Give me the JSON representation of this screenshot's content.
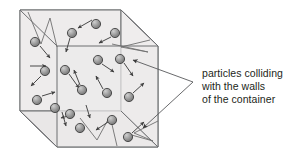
{
  "figure": {
    "title": "particles colliding with the walls of the container",
    "type": "gas-particle-container-diagram"
  },
  "caption": {
    "line1": "particles colliding",
    "line2": "with the walls",
    "line3": "of the container"
  },
  "colors": {
    "background": "#ffffff",
    "cube_line": "#6d6e71",
    "cube_face_front": "#eceaea",
    "cube_face_top": "#e4e2e2",
    "cube_face_left": "#e8e6e6",
    "particle_fill": "#9a9a9a",
    "particle_stroke": "#3b3b3b",
    "particle_highlight": "#d9d9d9",
    "arrow": "#404040",
    "callout_line": "#58595b",
    "text": "#231f20"
  },
  "container": {
    "label": "cube-container",
    "vertices": {
      "front_top_left": [
        57,
        46
      ],
      "front_top_right": [
        158,
        46
      ],
      "front_bottom_left": [
        57,
        147
      ],
      "front_bottom_right": [
        158,
        147
      ],
      "back_top_left": [
        20,
        10
      ],
      "back_top_right": [
        121,
        10
      ],
      "back_bottom_left": [
        20,
        111
      ],
      "back_bottom_right": [
        121,
        111
      ]
    }
  },
  "particles": [
    {
      "id": 1,
      "cx": 35,
      "cy": 42,
      "r": 4.6
    },
    {
      "id": 2,
      "cx": 45,
      "cy": 71,
      "r": 4.6
    },
    {
      "id": 3,
      "cx": 37,
      "cy": 100,
      "r": 4.6
    },
    {
      "id": 4,
      "cx": 72,
      "cy": 33,
      "r": 4.6
    },
    {
      "id": 5,
      "cx": 96,
      "cy": 24,
      "r": 4.6
    },
    {
      "id": 6,
      "cx": 115,
      "cy": 33,
      "r": 4.6
    },
    {
      "id": 7,
      "cx": 65,
      "cy": 70,
      "r": 4.6
    },
    {
      "id": 8,
      "cx": 98,
      "cy": 60,
      "r": 4.6
    },
    {
      "id": 9,
      "cx": 120,
      "cy": 59,
      "r": 4.6
    },
    {
      "id": 10,
      "cx": 82,
      "cy": 90,
      "r": 4.6
    },
    {
      "id": 11,
      "cx": 107,
      "cy": 93,
      "r": 4.6
    },
    {
      "id": 12,
      "cx": 129,
      "cy": 97,
      "r": 4.6
    },
    {
      "id": 13,
      "cx": 55,
      "cy": 108,
      "r": 4.6
    },
    {
      "id": 14,
      "cx": 70,
      "cy": 114,
      "r": 4.6
    },
    {
      "id": 15,
      "cx": 80,
      "cy": 128,
      "r": 4.6
    },
    {
      "id": 16,
      "cx": 112,
      "cy": 120,
      "r": 4.6
    },
    {
      "id": 17,
      "cx": 128,
      "cy": 137,
      "r": 4.6
    }
  ],
  "velocity_arrows": [
    {
      "from": [
        40,
        46
      ],
      "to": [
        50,
        58
      ]
    },
    {
      "from": [
        41,
        76
      ],
      "to": [
        31,
        86
      ]
    },
    {
      "from": [
        42,
        96
      ],
      "to": [
        55,
        92
      ]
    },
    {
      "from": [
        92,
        20
      ],
      "to": [
        78,
        28
      ]
    },
    {
      "from": [
        70,
        38
      ],
      "to": [
        66,
        52
      ]
    },
    {
      "from": [
        111,
        37
      ],
      "to": [
        99,
        43
      ]
    },
    {
      "from": [
        69,
        74
      ],
      "to": [
        79,
        88
      ]
    },
    {
      "from": [
        102,
        64
      ],
      "to": [
        114,
        72
      ]
    },
    {
      "from": [
        124,
        63
      ],
      "to": [
        133,
        76
      ]
    },
    {
      "from": [
        80,
        85
      ],
      "to": [
        74,
        70
      ]
    },
    {
      "from": [
        103,
        89
      ],
      "to": [
        96,
        76
      ]
    },
    {
      "from": [
        133,
        93
      ],
      "to": [
        144,
        83
      ]
    },
    {
      "from": [
        62,
        112
      ],
      "to": [
        66,
        126
      ]
    },
    {
      "from": [
        75,
        114
      ],
      "to": [
        61,
        118
      ]
    },
    {
      "from": [
        108,
        122
      ],
      "to": [
        96,
        130
      ]
    },
    {
      "from": [
        132,
        133
      ],
      "to": [
        144,
        122
      ]
    }
  ],
  "collision_paths": [
    {
      "name": "top-left-bounce",
      "points": [
        [
          28,
          12
        ],
        [
          41,
          44
        ],
        [
          50,
          18
        ],
        [
          57,
          47
        ]
      ]
    },
    {
      "name": "top-right-bounce",
      "points": [
        [
          150,
          40
        ],
        [
          121,
          47
        ],
        [
          148,
          52
        ],
        [
          112,
          44
        ]
      ]
    },
    {
      "name": "bottom-mid-bounce",
      "points": [
        [
          80,
          118
        ],
        [
          97,
          140
        ],
        [
          110,
          116
        ],
        [
          117,
          146
        ]
      ]
    },
    {
      "name": "bottom-right-bounce",
      "points": [
        [
          158,
          121
        ],
        [
          134,
          133
        ],
        [
          153,
          141
        ],
        [
          128,
          134
        ]
      ]
    }
  ],
  "callout": {
    "apex": [
      193,
      82
    ],
    "pointers": [
      {
        "from": [
          193,
          82
        ],
        "to": [
          133,
          60
        ]
      },
      {
        "from": [
          193,
          82
        ],
        "to": [
          143,
          128
        ]
      }
    ]
  }
}
